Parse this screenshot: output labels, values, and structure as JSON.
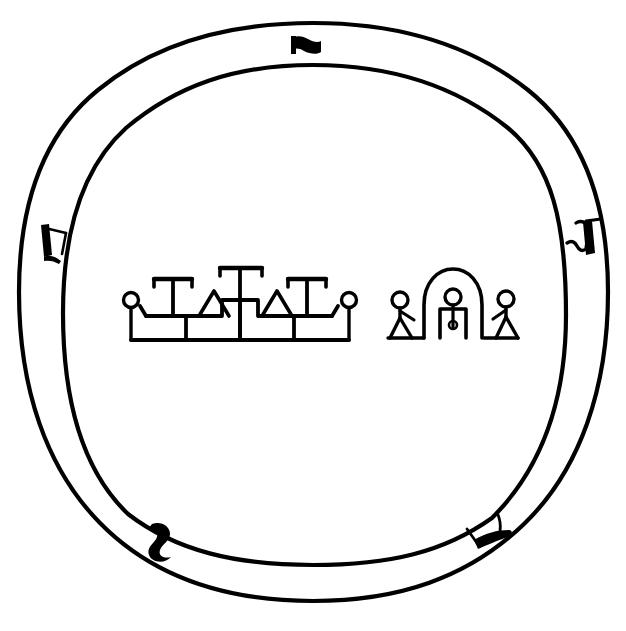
{
  "figure": {
    "caption": "",
    "background_color": "#ffffff",
    "ink_color": "#000000",
    "width": 626,
    "height": 631
  },
  "rim": {
    "name": "double-ring-border",
    "outer_circle": {
      "label": "outer rim circle",
      "cx": 313,
      "cy": 312,
      "rx": 295,
      "ry": 289,
      "stroke_width": 4
    },
    "inner_circle": {
      "label": "inner rim circle",
      "cx": 313,
      "cy": 315,
      "rx": 251,
      "ry": 250,
      "stroke_width": 4
    },
    "marks": [
      {
        "id": "rim-mark-top",
        "label": "top rim mark",
        "shape": "flag-glyph",
        "position": "top",
        "angle_degrees": 275,
        "x": 303,
        "y": 44
      },
      {
        "id": "rim-mark-left",
        "label": "left rim mark",
        "shape": "hook-glyph",
        "position": "left",
        "angle_degrees": 190,
        "x": 47,
        "y": 240
      },
      {
        "id": "rim-mark-right",
        "label": "right rim mark",
        "shape": "zigzag-glyph",
        "position": "right",
        "angle_degrees": 352,
        "x": 582,
        "y": 231
      },
      {
        "id": "rim-mark-bottom-left",
        "label": "bottom-left rim mark",
        "shape": "s-curve-glyph",
        "position": "bottom-left",
        "angle_degrees": 120,
        "x": 161,
        "y": 534
      },
      {
        "id": "rim-mark-bottom-right",
        "label": "bottom-right rim mark",
        "shape": "bent-bar-glyph",
        "position": "bottom-right",
        "angle_degrees": 60,
        "x": 484,
        "y": 531
      }
    ]
  },
  "central_scene": {
    "label": "central pictograph panel",
    "baseline_y": 340,
    "groups": [
      {
        "id": "left-glyph-group",
        "label": "stepped platform with T-posts and triangles",
        "x_start": 124,
        "x_end": 355,
        "elements": [
          {
            "name": "left-terminal-circle",
            "type": "circle-on-stem",
            "cx": 131,
            "cy": 301
          },
          {
            "name": "t-post-1",
            "type": "t-shape",
            "x": 172
          },
          {
            "name": "triangle-1",
            "type": "triangle",
            "x": 196
          },
          {
            "name": "t-post-2-tall",
            "type": "tall-t-shape",
            "x": 240
          },
          {
            "name": "triangle-2",
            "type": "triangle",
            "x": 277
          },
          {
            "name": "t-post-3",
            "type": "t-shape",
            "x": 307
          },
          {
            "name": "right-terminal-circle",
            "type": "circle-on-stem",
            "cx": 349,
            "cy": 301
          }
        ]
      },
      {
        "id": "right-glyph-group",
        "label": "two attendant figures flanking an arched shrine",
        "x_start": 388,
        "x_end": 518,
        "elements": [
          {
            "name": "attendant-figure-left",
            "type": "stick-figure",
            "cx": 400,
            "cy": 303
          },
          {
            "name": "arched-shrine",
            "type": "arch",
            "cx": 453,
            "cy": 308
          },
          {
            "name": "shrine-occupant-figure",
            "type": "headed-stem-figure",
            "cx": 453,
            "cy": 300
          },
          {
            "name": "shrine-doorway",
            "type": "rectangular-niche",
            "cx": 453
          },
          {
            "name": "attendant-figure-right",
            "type": "stick-figure",
            "cx": 508,
            "cy": 300
          }
        ]
      }
    ]
  }
}
